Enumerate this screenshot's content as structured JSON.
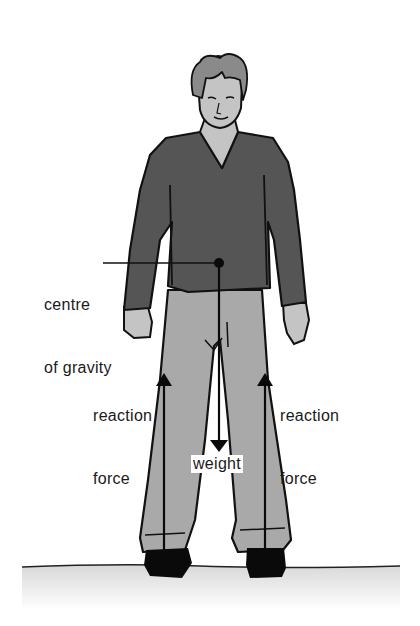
{
  "diagram": {
    "labels": {
      "centre_of_gravity": {
        "line1": "centre",
        "line2": "of gravity"
      },
      "reaction_force_left": {
        "line1": "reaction",
        "line2": "force"
      },
      "reaction_force_right": {
        "line1": "reaction",
        "line2": "force"
      },
      "weight": "weight"
    },
    "arrows": [
      {
        "name": "weight",
        "direction": "down",
        "from": "centre of gravity"
      },
      {
        "name": "reaction force (left foot)",
        "direction": "up"
      },
      {
        "name": "reaction force (right foot)",
        "direction": "up"
      }
    ],
    "colors": {
      "background": "#ffffff",
      "shirt": "#555555",
      "trousers": "#a9a9a9",
      "skin": "#c4c4c4",
      "hair": "#8a8a8a",
      "shoes": "#0a0a0a",
      "outline": "#111111",
      "ground_shadow": "#dcdcdc"
    }
  }
}
